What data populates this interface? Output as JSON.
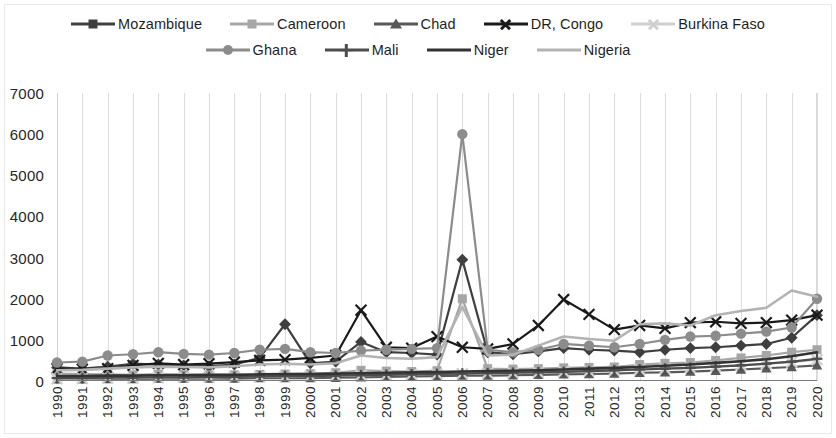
{
  "chart_data": {
    "type": "line",
    "title": "",
    "xlabel": "",
    "ylabel": "",
    "ylim": [
      0,
      7000
    ],
    "ytick_values": [
      0,
      1000,
      2000,
      3000,
      4000,
      5000,
      6000,
      7000
    ],
    "ytick_labels": [
      "0",
      "1000",
      "2000",
      "3000",
      "4000",
      "5000",
      "6000",
      "7000"
    ],
    "grid": "vertical-only",
    "legend_position": "top",
    "x": [
      1990,
      1991,
      1992,
      1993,
      1994,
      1995,
      1996,
      1997,
      1998,
      1999,
      2000,
      2001,
      2002,
      2003,
      2004,
      2005,
      2006,
      2007,
      2008,
      2009,
      2010,
      2011,
      2012,
      2013,
      2014,
      2015,
      2016,
      2017,
      2018,
      2019,
      2020
    ],
    "categories": [
      "1990",
      "1991",
      "1992",
      "1993",
      "1994",
      "1995",
      "1996",
      "1997",
      "1998",
      "1999",
      "2000",
      "2001",
      "2002",
      "2003",
      "2004",
      "2005",
      "2006",
      "2007",
      "2008",
      "2009",
      "2010",
      "2011",
      "2012",
      "2013",
      "2014",
      "2015",
      "2016",
      "2017",
      "2018",
      "2019",
      "2020"
    ],
    "series": [
      {
        "name": "Mozambique",
        "color": "#3f3f3f",
        "marker": "diamond",
        "values": [
          330,
          300,
          350,
          420,
          400,
          380,
          360,
          400,
          560,
          1380,
          430,
          470,
          950,
          700,
          680,
          640,
          2950,
          700,
          650,
          720,
          800,
          760,
          740,
          700,
          760,
          800,
          820,
          860,
          900,
          1050,
          1600
        ]
      },
      {
        "name": "Cameroon",
        "color": "#a6a6a6",
        "marker": "square",
        "values": [
          180,
          170,
          160,
          150,
          170,
          160,
          150,
          150,
          160,
          170,
          180,
          200,
          260,
          240,
          230,
          250,
          2000,
          300,
          290,
          300,
          320,
          330,
          340,
          400,
          430,
          450,
          500,
          560,
          620,
          700,
          760
        ]
      },
      {
        "name": "Chad",
        "color": "#595959",
        "marker": "triangle",
        "values": [
          40,
          40,
          50,
          50,
          60,
          60,
          60,
          60,
          70,
          70,
          70,
          80,
          90,
          100,
          110,
          120,
          130,
          130,
          140,
          150,
          160,
          170,
          180,
          200,
          210,
          230,
          250,
          280,
          310,
          340,
          380
        ]
      },
      {
        "name": "DR, Congo",
        "color": "#1a1a1a",
        "marker": "x",
        "values": [
          300,
          290,
          300,
          380,
          430,
          400,
          420,
          460,
          500,
          520,
          560,
          620,
          1720,
          820,
          800,
          1080,
          820,
          780,
          900,
          1350,
          1980,
          1620,
          1250,
          1350,
          1280,
          1420,
          1440,
          1400,
          1420,
          1480,
          1600
        ]
      },
      {
        "name": "Burkina Faso",
        "color": "#cfcfcf",
        "marker": "x",
        "values": [
          60,
          60,
          70,
          70,
          80,
          90,
          90,
          100,
          110,
          110,
          120,
          130,
          140,
          150,
          160,
          170,
          180,
          190,
          200,
          210,
          230,
          240,
          260,
          280,
          300,
          320,
          350,
          380,
          420,
          460,
          520
        ]
      },
      {
        "name": "Ghana",
        "color": "#8c8c8c",
        "marker": "circle",
        "values": [
          450,
          470,
          620,
          650,
          700,
          660,
          640,
          680,
          760,
          780,
          700,
          680,
          740,
          760,
          780,
          800,
          6000,
          760,
          700,
          760,
          900,
          860,
          820,
          900,
          1000,
          1080,
          1100,
          1150,
          1200,
          1300,
          2000
        ]
      },
      {
        "name": "Mali",
        "color": "#4d4d4d",
        "marker": "plus",
        "values": [
          70,
          70,
          80,
          80,
          90,
          90,
          100,
          100,
          110,
          120,
          120,
          130,
          140,
          150,
          160,
          170,
          180,
          190,
          200,
          210,
          220,
          240,
          260,
          280,
          300,
          320,
          350,
          380,
          420,
          470,
          540
        ]
      },
      {
        "name": "Niger",
        "color": "#333333",
        "marker": "none",
        "values": [
          120,
          120,
          130,
          130,
          140,
          140,
          150,
          150,
          160,
          170,
          170,
          180,
          190,
          200,
          210,
          220,
          230,
          240,
          250,
          260,
          280,
          300,
          320,
          340,
          370,
          400,
          440,
          480,
          530,
          600,
          700
        ]
      },
      {
        "name": "Nigeria",
        "color": "#b3b3b3",
        "marker": "none",
        "values": [
          260,
          270,
          300,
          330,
          350,
          340,
          330,
          360,
          400,
          420,
          400,
          430,
          620,
          560,
          540,
          580,
          1800,
          620,
          640,
          860,
          1080,
          1020,
          980,
          1380,
          1400,
          1350,
          1600,
          1700,
          1780,
          2200,
          2050
        ]
      }
    ]
  },
  "legend": {
    "rows": [
      [
        {
          "label": "Mozambique"
        },
        {
          "label": "Cameroon"
        },
        {
          "label": "Chad"
        },
        {
          "label": "DR, Congo"
        },
        {
          "label": "Burkina Faso"
        }
      ],
      [
        {
          "label": "Ghana"
        },
        {
          "label": "Mali"
        },
        {
          "label": "Niger"
        },
        {
          "label": "Nigeria"
        }
      ]
    ]
  }
}
